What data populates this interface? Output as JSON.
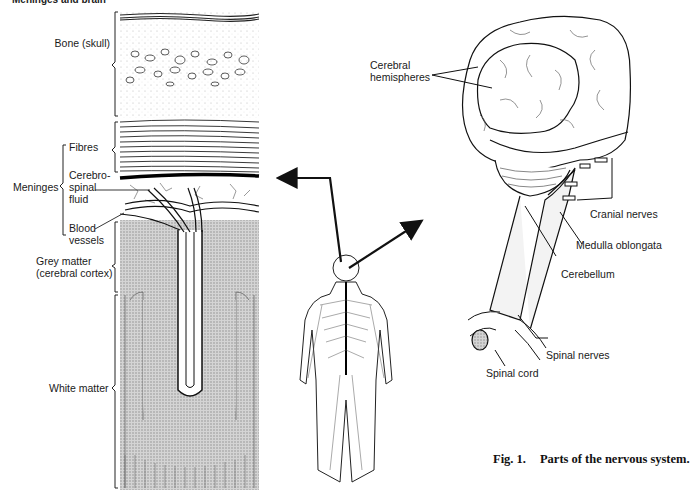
{
  "figure": {
    "title": "Meninges and brain",
    "caption_number": "Fig. 1.",
    "caption_text": "Parts of the nervous system."
  },
  "section_diagram": {
    "labels": {
      "bone": "Bone (skull)",
      "meninges": "Meninges",
      "fibres": "Fibres",
      "csf_1": "Cerebro-",
      "csf_2": "spinal",
      "csf_3": "fluid",
      "blood_1": "Blood",
      "blood_2": "vessels",
      "grey_1": "Grey matter",
      "grey_2": "(cerebral cortex)",
      "white": "White matter"
    }
  },
  "brain_diagram": {
    "labels": {
      "hemispheres_1": "Cerebral",
      "hemispheres_2": "hemispheres",
      "cranial_nerves": "Cranial nerves",
      "medulla": "Medulla oblongata",
      "cerebellum": "Cerebellum",
      "spinal_nerves": "Spinal nerves",
      "spinal_cord": "Spinal cord"
    }
  },
  "colors": {
    "ink": "#111111",
    "grey_matter": "#bdbdbd",
    "background": "#ffffff"
  }
}
